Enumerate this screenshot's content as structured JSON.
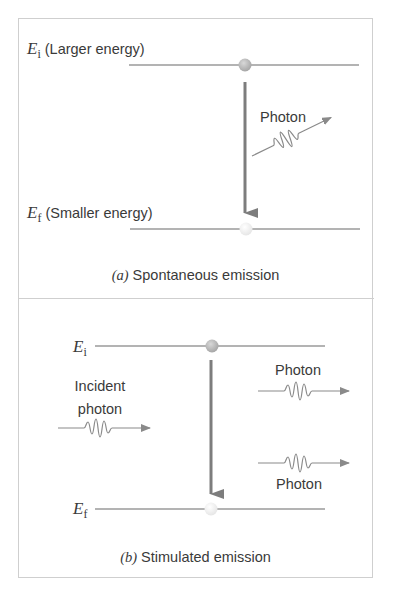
{
  "panel_a": {
    "upper_level": {
      "symbol": "E",
      "subscript": "i",
      "description": "(Larger energy)"
    },
    "lower_level": {
      "symbol": "E",
      "subscript": "f",
      "description": "(Smaller energy)"
    },
    "photon_label": "Photon",
    "caption_letter": "(a)",
    "caption_text": "Spontaneous emission"
  },
  "panel_b": {
    "upper_level": {
      "symbol": "E",
      "subscript": "i"
    },
    "lower_level": {
      "symbol": "E",
      "subscript": "f"
    },
    "incident_label_line1": "Incident",
    "incident_label_line2": "photon",
    "photon_label_upper": "Photon",
    "photon_label_lower": "Photon",
    "caption_letter": "(b)",
    "caption_text": "Stimulated emission"
  },
  "colors": {
    "line": "#9a9a9a",
    "arrow": "#7d7d7d",
    "electron_filled": "#b3b3b3",
    "electron_empty": "#eeeeee",
    "border": "#cfcfcf"
  }
}
